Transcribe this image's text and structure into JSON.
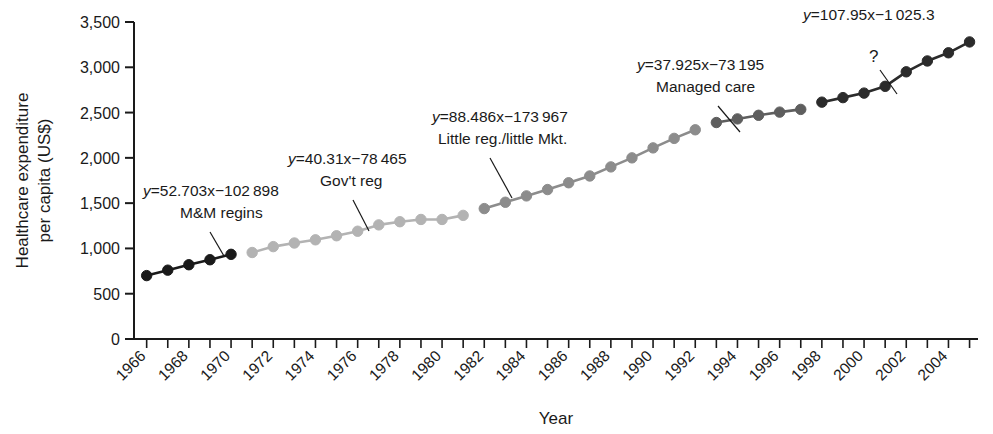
{
  "chart_data": {
    "type": "line",
    "title": "",
    "xlabel": "Year",
    "ylabel": "Healthcare expenditure\nper capita (US$)",
    "ylabel_line1": "Healthcare expenditure",
    "ylabel_line2": "per capita (US$)",
    "xlim": [
      1965.4,
      2005.4
    ],
    "ylim": [
      0,
      3500
    ],
    "grid": false,
    "legend": "none",
    "y_ticks": [
      0,
      500,
      1000,
      1500,
      2000,
      2500,
      3000,
      3500
    ],
    "y_tick_labels": [
      "0",
      "500",
      "1,000",
      "1,500",
      "2,000",
      "2,500",
      "3,000",
      "3,500"
    ],
    "x_ticks": [
      1966,
      1967,
      1968,
      1969,
      1970,
      1971,
      1972,
      1973,
      1974,
      1975,
      1976,
      1977,
      1978,
      1979,
      1980,
      1981,
      1982,
      1983,
      1984,
      1985,
      1986,
      1987,
      1988,
      1989,
      1990,
      1991,
      1992,
      1993,
      1994,
      1995,
      1996,
      1997,
      1998,
      1999,
      2000,
      2001,
      2002,
      2003,
      2004,
      2005
    ],
    "x_tick_labels_shown": [
      "1966",
      "1968",
      "1970",
      "1972",
      "1974",
      "1976",
      "1978",
      "1980",
      "1982",
      "1984",
      "1986",
      "1988",
      "1990",
      "1992",
      "1994",
      "1996",
      "1998",
      "2000",
      "2002",
      "2004"
    ],
    "x_tick_label_rotation": -45,
    "series": [
      {
        "name": "M&M regins",
        "color": "#1a1a1a",
        "equation": "y=52.703x−102 898",
        "slope": 52.703,
        "intercept": -102898,
        "x": [
          1966,
          1967,
          1968,
          1969,
          1970
        ],
        "values": [
          700,
          760,
          820,
          875,
          935
        ]
      },
      {
        "name": "Gov't reg",
        "color": "#b3b3b3",
        "equation": "y=40.31x−78 465",
        "slope": 40.31,
        "intercept": -78465,
        "x": [
          1971,
          1972,
          1973,
          1974,
          1975,
          1976,
          1977,
          1978,
          1979,
          1980,
          1981
        ],
        "values": [
          955,
          1020,
          1060,
          1095,
          1140,
          1190,
          1260,
          1295,
          1320,
          1320,
          1365
        ]
      },
      {
        "name": "Little reg./little Mkt.",
        "color": "#8c8c8c",
        "equation": "y=88.486x−173 967",
        "slope": 88.486,
        "intercept": -173967,
        "x": [
          1982,
          1983,
          1984,
          1985,
          1986,
          1987,
          1988,
          1989,
          1990,
          1991,
          1992
        ],
        "values": [
          1440,
          1510,
          1580,
          1650,
          1725,
          1800,
          1900,
          2000,
          2110,
          2215,
          2310
        ]
      },
      {
        "name": "Managed care",
        "color": "#5e5e5e",
        "equation": "y=37.925x−73 195",
        "slope": 37.925,
        "intercept": -73195,
        "x": [
          1993,
          1994,
          1995,
          1996,
          1997
        ],
        "values": [
          2390,
          2430,
          2470,
          2505,
          2535
        ]
      },
      {
        "name": "?",
        "color": "#2b2b2b",
        "equation": "y=107.95x−1 025.3",
        "slope": 107.95,
        "intercept": -1025.3,
        "x": [
          1998,
          1999,
          2000,
          2001,
          2002,
          2003,
          2004,
          2005
        ],
        "values": [
          2615,
          2665,
          2715,
          2790,
          2950,
          3070,
          3160,
          3280
        ]
      }
    ],
    "annotations": [
      {
        "id": "ann-mm",
        "equation": "y=52.703x−102 898",
        "label": "M&M regins",
        "leader_to_year": 1969.6
      },
      {
        "id": "ann-gov",
        "equation": "y=40.31x−78 465",
        "label": "Gov't reg",
        "leader_to_year": 1976.0
      },
      {
        "id": "ann-little",
        "equation": "y=88.486x−173 967",
        "label": "Little reg./little Mkt.",
        "leader_to_year": 1986.9
      },
      {
        "id": "ann-managed",
        "equation": "y=37.925x−73 195",
        "label": "Managed care",
        "leader_to_year": 1995.0
      },
      {
        "id": "ann-question",
        "equation": "y=107.95x−1 025.3",
        "label": "?",
        "leader_to_year": 2001.0
      }
    ]
  }
}
